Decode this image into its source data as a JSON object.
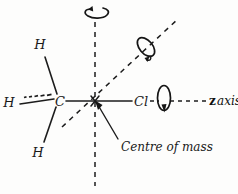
{
  "figure": {
    "background_color": "#fdfdfc",
    "ink_color": "#1c1c1c",
    "width": 238,
    "height": 194
  },
  "atoms": [
    {
      "id": "h-upper-left",
      "label": "H",
      "x": 40,
      "y": 49,
      "bond_style": "plain-line"
    },
    {
      "id": "h-left",
      "label": "H",
      "x": 9,
      "y": 102,
      "bond_style": "hashed-wedge"
    },
    {
      "id": "h-lower-left",
      "label": "H",
      "x": 38,
      "y": 152,
      "bond_style": "plain-line"
    },
    {
      "id": "carbon",
      "label": "C",
      "x": 59,
      "y": 101,
      "bond_style": "none"
    },
    {
      "id": "chlorine",
      "label": "Cl",
      "x": 134,
      "y": 101,
      "bond_style": "plain-line"
    }
  ],
  "axes": [
    {
      "id": "vertical-axis",
      "style": "dashed",
      "orientation": "vertical",
      "label": ""
    },
    {
      "id": "diagonal-axis",
      "style": "dashed",
      "orientation": "diagonal",
      "label": ""
    },
    {
      "id": "z-axis",
      "style": "dashed",
      "orientation": "horizontal",
      "label_bold": "z",
      "label_italic": "axis"
    }
  ],
  "rotation_arrows": [
    {
      "id": "rotation-vertical",
      "about": "vertical-axis",
      "cx": 96,
      "cy": 14
    },
    {
      "id": "rotation-diagonal",
      "about": "diagonal-axis",
      "cx": 146,
      "cy": 47
    },
    {
      "id": "rotation-z",
      "about": "z-axis",
      "cx": 163,
      "cy": 98
    }
  ],
  "annotations": [
    {
      "id": "centre-of-mass",
      "text": "Centre of mass",
      "text_x": 121,
      "text_y": 150,
      "pointer_from_x": 118,
      "pointer_from_y": 139,
      "pointer_to_x": 95,
      "pointer_to_y": 101
    }
  ],
  "molecule": {
    "formula_description": "CH3Cl",
    "centre_of_mass_x": 95,
    "centre_of_mass_y": 101
  }
}
